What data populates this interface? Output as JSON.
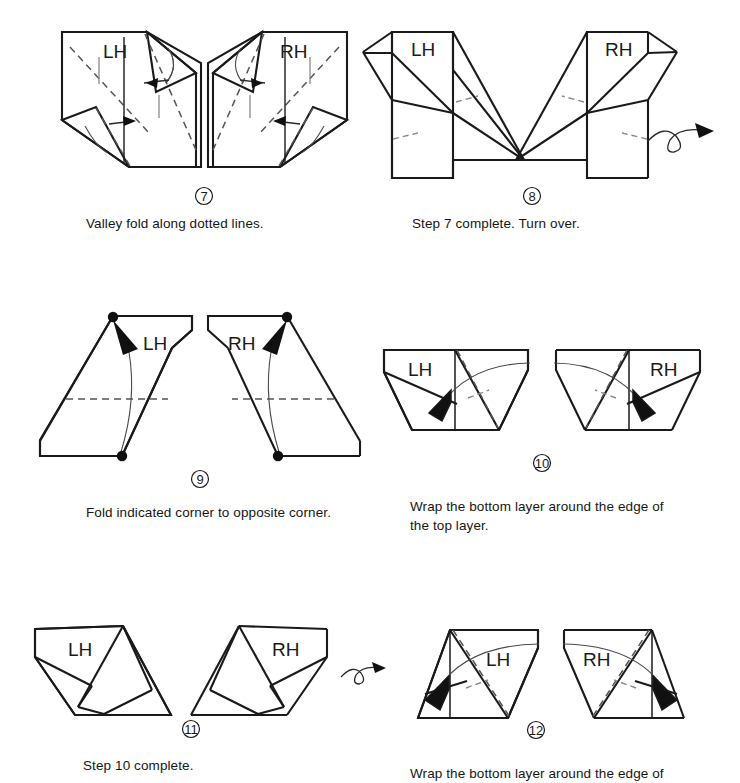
{
  "document": {
    "title": "Origami folding instructions — steps 7 through 12",
    "background_color": "#ffffff",
    "ink_color": "#1a1a1a",
    "fold_line_color": "#555555"
  },
  "steps": [
    {
      "number": "7",
      "number_glyph": "⑦",
      "caption": "Valley fold along dotted lines.",
      "panels": [
        {
          "hand": "LH",
          "label": "LH"
        },
        {
          "hand": "RH",
          "label": "RH"
        }
      ],
      "has_turn_over_arrow": false
    },
    {
      "number": "8",
      "number_glyph": "⑧",
      "caption": "Step 7 complete. Turn over.",
      "panels": [
        {
          "hand": "LH",
          "label": "LH"
        },
        {
          "hand": "RH",
          "label": "RH"
        }
      ],
      "has_turn_over_arrow": true
    },
    {
      "number": "9",
      "number_glyph": "⑨",
      "caption": "Fold indicated corner to opposite corner.",
      "panels": [
        {
          "hand": "LH",
          "label": "LH"
        },
        {
          "hand": "RH",
          "label": "RH"
        }
      ],
      "has_turn_over_arrow": false
    },
    {
      "number": "10",
      "number_glyph": "⑩",
      "caption": "Wrap the bottom layer around the edge of\nthe top layer.",
      "panels": [
        {
          "hand": "LH",
          "label": "LH"
        },
        {
          "hand": "RH",
          "label": "RH"
        }
      ],
      "has_turn_over_arrow": false
    },
    {
      "number": "11",
      "number_glyph": "⑪",
      "caption": "Step 10 complete.",
      "panels": [
        {
          "hand": "LH",
          "label": "LH"
        },
        {
          "hand": "RH",
          "label": "RH"
        }
      ],
      "has_turn_over_arrow": true
    },
    {
      "number": "12",
      "number_glyph": "⑫",
      "caption": "Wrap the bottom layer around the edge of",
      "panels": [
        {
          "hand": "LH",
          "label": "LH"
        },
        {
          "hand": "RH",
          "label": "RH"
        }
      ],
      "has_turn_over_arrow": false
    }
  ]
}
